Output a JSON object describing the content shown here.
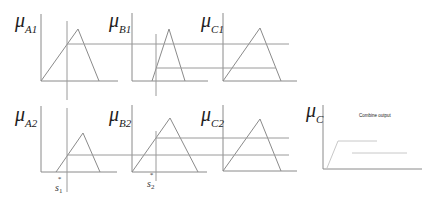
{
  "labels": {
    "a1": {
      "base": "μ",
      "sub": "A1"
    },
    "b1": {
      "base": "μ",
      "sub": "B1"
    },
    "c1": {
      "base": "μ",
      "sub": "C1"
    },
    "a2": {
      "base": "μ",
      "sub": "A2"
    },
    "b2": {
      "base": "μ",
      "sub": "B2"
    },
    "c2": {
      "base": "μ",
      "sub": "C2"
    },
    "c": {
      "base": "μ",
      "sub": "C"
    }
  },
  "inputs": {
    "s1": {
      "base": "s",
      "sub": "1",
      "sup": "*"
    },
    "s2": {
      "base": "s",
      "sub": "2",
      "sup": "*"
    }
  },
  "combined": {
    "title": "Combine output"
  },
  "colors": {
    "line": "#8a8a8a",
    "guide": "#9a9a9a",
    "faint": "#c8c8c8",
    "text": "#222222"
  }
}
